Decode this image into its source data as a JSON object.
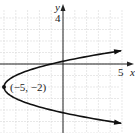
{
  "chart_data": {
    "type": "line",
    "title": "",
    "xlabel": "x",
    "ylabel": "y",
    "equation": "x = (y + 2)^2 - 5",
    "vertex": {
      "x": -5,
      "y": -2,
      "label": "(−5, −2)"
    },
    "tick_labels": {
      "x": [
        "5"
      ],
      "y": [
        "4"
      ]
    },
    "xlim": [
      -5.3,
      6
    ],
    "ylim": [
      -5.8,
      5.5
    ],
    "grid": true,
    "series": [
      {
        "name": "parabola",
        "points": [
          [
            5.2,
            1.19
          ],
          [
            4,
            1
          ],
          [
            1.25,
            0.5
          ],
          [
            0,
            0.24
          ],
          [
            -1,
            0
          ],
          [
            -3.75,
            -1
          ],
          [
            -5,
            -2
          ],
          [
            -3.75,
            -3
          ],
          [
            -1,
            -4
          ],
          [
            0,
            -4.24
          ],
          [
            1.25,
            -4.5
          ],
          [
            4,
            -5
          ],
          [
            5.2,
            -5.19
          ]
        ]
      }
    ]
  },
  "labels": {
    "y_axis": "y",
    "x_axis": "x",
    "y_tick": "4",
    "x_tick": "5",
    "vertex": "(−5, −2)"
  },
  "colors": {
    "curve": "#111111",
    "axis": "#222222",
    "grid": "#d8d8d8"
  }
}
